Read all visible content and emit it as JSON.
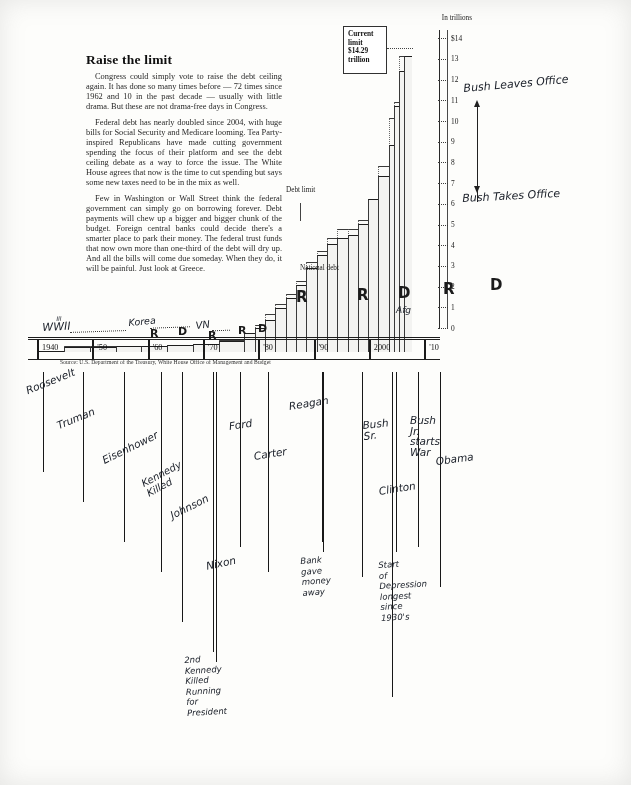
{
  "article": {
    "headline": "Raise the limit",
    "paragraphs": [
      "Congress could simply vote to raise the debt ceiling again. It has done so many times before — 72 times since 1962 and 10 in the past decade — usually with little drama. But these are not drama-free days in Congress.",
      "Federal debt has nearly doubled since 2004, with huge bills for Social Security and Medicare looming. Tea Party-inspired Republicans have made cutting government spending the focus of their platform and see the debt ceiling debate as a way to force the issue. The White House agrees that now is the time to cut spending but says some new taxes need to be in the mix as well.",
      "Few in Washington or Wall Street think the federal government can simply go on borrowing forever. Debt payments will chew up a bigger and bigger chunk of the budget. Foreign central banks could decide there's a smarter place to park their money. The federal trust funds that now own more than one-third of the debt will dry up. And all the bills will come due someday. When they do, it will be painful. Just look at Greece."
    ]
  },
  "callouts": {
    "current_limit": "Current limit $14.29 trillion",
    "current_limit_lines": [
      "Current",
      "limit",
      "$14.29",
      "trillion"
    ],
    "debt_limit_label": "Debt limit",
    "national_debt_label": "National debt"
  },
  "chart_data": {
    "type": "area",
    "xlabel": "",
    "ylabel": "In trillions",
    "ylim": [
      0,
      14.4
    ],
    "grid": false,
    "legend": "inline annotations",
    "ytick_labels": [
      "$14",
      "13",
      "12",
      "11",
      "10",
      "9",
      "8",
      "7",
      "6",
      "5",
      "4",
      "3",
      "2",
      "1",
      "0"
    ],
    "ytick_values": [
      14,
      13,
      12,
      11,
      10,
      9,
      8,
      7,
      6,
      5,
      4,
      3,
      2,
      1,
      0
    ],
    "xtick_labels": [
      "1940",
      "'50",
      "'60",
      "'70",
      "'80",
      "'90",
      "2000",
      "'10"
    ],
    "xtick_values": [
      1940,
      1950,
      1960,
      1970,
      1980,
      1990,
      2000,
      2010
    ],
    "x": [
      1940,
      1945,
      1950,
      1955,
      1960,
      1965,
      1970,
      1975,
      1980,
      1982,
      1984,
      1986,
      1988,
      1990,
      1992,
      1994,
      1996,
      1998,
      2000,
      2002,
      2004,
      2006,
      2008,
      2009,
      2010,
      2011
    ],
    "series": [
      {
        "name": "National debt",
        "values": [
          0.05,
          0.26,
          0.26,
          0.27,
          0.29,
          0.32,
          0.38,
          0.54,
          0.91,
          1.14,
          1.57,
          2.12,
          2.6,
          3.23,
          4.06,
          4.69,
          5.22,
          5.53,
          5.67,
          6.2,
          7.38,
          8.5,
          10.02,
          11.9,
          13.56,
          14.29
        ]
      },
      {
        "name": "Debt limit",
        "values": [
          0.05,
          0.3,
          0.28,
          0.28,
          0.29,
          0.33,
          0.4,
          0.6,
          0.93,
          1.29,
          1.82,
          2.3,
          2.8,
          3.42,
          4.37,
          4.9,
          5.5,
          5.95,
          5.95,
          6.4,
          7.38,
          8.97,
          11.32,
          12.1,
          14.29,
          14.29
        ]
      }
    ],
    "annotations": [
      {
        "text": "Current limit $14.29 trillion",
        "at_y": 14.29
      },
      {
        "text": "Debt limit",
        "at_y": 6.2
      },
      {
        "text": "National debt",
        "at_y": 2.4
      }
    ]
  },
  "xaxis": {
    "labels": [
      "1940",
      "'50",
      "'60",
      "'70",
      "'80",
      "'90",
      "2000",
      "'10"
    ]
  },
  "source": "Source: U.S. Department of the Treasury, White House Office of Management and Budget",
  "handwriting": {
    "era_labels": [
      {
        "name": "wwii-label",
        "text": "WWII"
      },
      {
        "name": "wwii-superscript",
        "text": "III"
      },
      {
        "name": "korea-label",
        "text": "Korea"
      },
      {
        "name": "vietnam-label",
        "text": "VN"
      }
    ],
    "party_letters": [
      {
        "name": "party-letter-r-1955",
        "text": "R"
      },
      {
        "name": "party-letter-d-1962",
        "text": "D"
      },
      {
        "name": "party-letter-r-1970",
        "text": "R"
      },
      {
        "name": "party-letter-r-1974",
        "text": "R"
      },
      {
        "name": "party-letter-d-1978",
        "text": "D"
      },
      {
        "name": "party-letter-r-1984",
        "text": "R"
      },
      {
        "name": "party-letter-r-1990",
        "text": "R"
      },
      {
        "name": "party-letter-d-1996",
        "text": "D"
      },
      {
        "name": "party-letter-r-2004",
        "text": "R"
      },
      {
        "name": "party-letter-d-2010",
        "text": "D"
      },
      {
        "name": "party-letter-afg",
        "text": "Afg"
      }
    ],
    "arrows": [
      {
        "name": "bush-leaves-office-note",
        "text": "Bush Leaves Office"
      },
      {
        "name": "bush-takes-office-note",
        "text": "Bush Takes Office"
      }
    ],
    "president_notes": [
      {
        "name": "note-roosevelt",
        "text": "Roosevelt"
      },
      {
        "name": "note-truman",
        "text": "Truman"
      },
      {
        "name": "note-eisenhower",
        "text": "Eisenhower"
      },
      {
        "name": "note-kennedy-killed",
        "text": "Kennedy\nKilled"
      },
      {
        "name": "note-johnson",
        "text": "Johnson"
      },
      {
        "name": "note-nixon",
        "text": "Nixon"
      },
      {
        "name": "note-ford",
        "text": "Ford"
      },
      {
        "name": "note-carter",
        "text": "Carter"
      },
      {
        "name": "note-reagan",
        "text": "Reagan"
      },
      {
        "name": "note-bush-sr",
        "text": "Bush\nSr."
      },
      {
        "name": "note-clinton",
        "text": "Clinton"
      },
      {
        "name": "note-bush-jr",
        "text": "Bush\nJr.\nstarts\nWar"
      },
      {
        "name": "note-obama",
        "text": "Obama"
      }
    ],
    "event_notes": [
      {
        "name": "note-bank-gave-money-away",
        "text": "Bank\ngave\nmoney\naway"
      },
      {
        "name": "note-depression",
        "text": "Start\nof\nDepression\nlongest\nsince\n1930's"
      },
      {
        "name": "note-second-kennedy",
        "text": "2nd\nKennedy\nKilled\nRunning\nfor\nPresident"
      }
    ]
  },
  "colors": {
    "ink": "#1d1d1d",
    "handwriting": "#20252e",
    "paper": "#fdfdfb"
  }
}
